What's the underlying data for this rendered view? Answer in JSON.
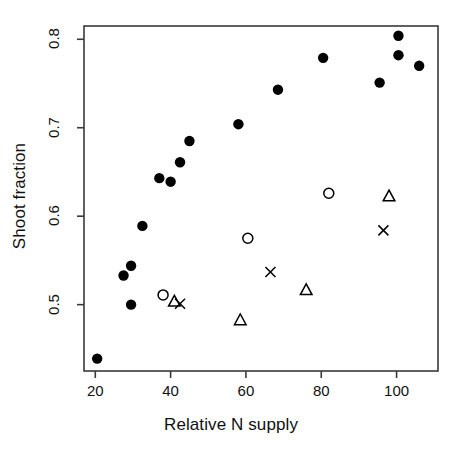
{
  "chart_data": {
    "type": "scatter",
    "title": "",
    "xlabel": "Relative N supply",
    "ylabel": "Shoot fraction",
    "xlim": [
      17,
      111
    ],
    "ylim": [
      0.425,
      0.815
    ],
    "grid": false,
    "legend": "none",
    "xticks": [
      20,
      40,
      60,
      80,
      100
    ],
    "xtick_labels": [
      "20",
      "40",
      "60",
      "80",
      "100"
    ],
    "yticks": [
      0.5,
      0.6,
      0.7,
      0.8
    ],
    "ytick_labels": [
      "0.5",
      "0.6",
      "0.7",
      "0.8"
    ],
    "series": [
      {
        "name": "filled-circle",
        "marker": "filled-circle",
        "color": "#000000",
        "points": [
          {
            "x": 20.5,
            "y": 0.439
          },
          {
            "x": 27.5,
            "y": 0.533
          },
          {
            "x": 29.5,
            "y": 0.544
          },
          {
            "x": 29.5,
            "y": 0.5
          },
          {
            "x": 32.5,
            "y": 0.589
          },
          {
            "x": 37.0,
            "y": 0.643
          },
          {
            "x": 40.0,
            "y": 0.639
          },
          {
            "x": 42.5,
            "y": 0.661
          },
          {
            "x": 45.0,
            "y": 0.685
          },
          {
            "x": 58.0,
            "y": 0.704
          },
          {
            "x": 68.5,
            "y": 0.743
          },
          {
            "x": 80.5,
            "y": 0.779
          },
          {
            "x": 95.5,
            "y": 0.751
          },
          {
            "x": 100.5,
            "y": 0.804
          },
          {
            "x": 100.5,
            "y": 0.782
          },
          {
            "x": 106.0,
            "y": 0.77
          }
        ]
      },
      {
        "name": "open-circle",
        "marker": "open-circle",
        "color": "#000000",
        "points": [
          {
            "x": 38.0,
            "y": 0.511
          },
          {
            "x": 60.5,
            "y": 0.575
          },
          {
            "x": 82.0,
            "y": 0.626
          }
        ]
      },
      {
        "name": "open-triangle",
        "marker": "open-triangle",
        "color": "#000000",
        "points": [
          {
            "x": 41.0,
            "y": 0.503
          },
          {
            "x": 58.5,
            "y": 0.482
          },
          {
            "x": 76.0,
            "y": 0.516
          },
          {
            "x": 98.0,
            "y": 0.622
          }
        ]
      },
      {
        "name": "cross",
        "marker": "x",
        "color": "#000000",
        "points": [
          {
            "x": 42.5,
            "y": 0.501
          },
          {
            "x": 66.5,
            "y": 0.537
          },
          {
            "x": 96.5,
            "y": 0.584
          }
        ]
      }
    ]
  },
  "axes": {
    "frame_color": "#3a3a3a",
    "plot_box": {
      "left": 84,
      "top": 26,
      "right": 438,
      "bottom": 371
    }
  }
}
